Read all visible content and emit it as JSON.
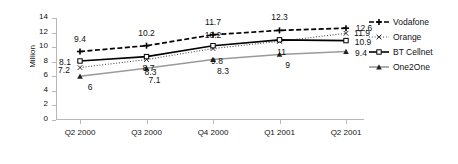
{
  "chart_data": {
    "type": "line",
    "title": "",
    "xlabel": "",
    "ylabel": "Million",
    "categories": [
      "Q2 2000",
      "Q3 2000",
      "Q4 2000",
      "Q1 2001",
      "Q2 2001"
    ],
    "ylim": [
      0,
      14
    ],
    "yticks": [
      0,
      2,
      4,
      6,
      8,
      10,
      12,
      14
    ],
    "grid": false,
    "legend_position": "right",
    "series": [
      {
        "name": "Vodafone",
        "values": [
          9.4,
          10.2,
          11.7,
          12.3,
          12.6
        ],
        "labels": [
          "9.4",
          "10.2",
          "11.7",
          "12.3",
          "12.6"
        ],
        "color": "#000000",
        "line_style": "dashed",
        "marker": "plus"
      },
      {
        "name": "Orange",
        "values": [
          7.2,
          8.3,
          9.8,
          10.8,
          11.9
        ],
        "labels": [
          "7.2",
          "8.3",
          "9.8",
          "",
          "11.9"
        ],
        "color": "#4d4d4d",
        "line_style": "dotted",
        "marker": "x"
      },
      {
        "name": "BT Cellnet",
        "values": [
          8.1,
          8.7,
          10.2,
          11,
          10.9
        ],
        "labels": [
          "8.1",
          "8.7",
          "10.2",
          "11",
          "10.9"
        ],
        "color": "#000000",
        "line_style": "solid",
        "marker": "square"
      },
      {
        "name": "One2One",
        "values": [
          6,
          7.1,
          8.3,
          9,
          9.4
        ],
        "labels": [
          "6",
          "7.1",
          "8.3",
          "9",
          "9.4"
        ],
        "color": "#9a9a9a",
        "line_style": "solid",
        "marker": "triangle"
      }
    ],
    "label_offsets": [
      [
        [
          0,
          -13
        ],
        [
          0,
          -13
        ],
        [
          0,
          -13
        ],
        [
          0,
          -13
        ],
        [
          18,
          0
        ]
      ],
      [
        [
          -16,
          2
        ],
        [
          4,
          12
        ],
        [
          4,
          12
        ],
        [
          0,
          0
        ],
        [
          16,
          0
        ]
      ],
      [
        [
          -15,
          1
        ],
        [
          2,
          11
        ],
        [
          0,
          -11
        ],
        [
          2,
          12
        ],
        [
          17,
          1
        ]
      ],
      [
        [
          10,
          11
        ],
        [
          8,
          12
        ],
        [
          10,
          11
        ],
        [
          8,
          11
        ],
        [
          15,
          1
        ]
      ]
    ]
  }
}
